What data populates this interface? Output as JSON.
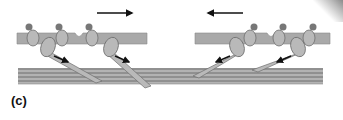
{
  "figure": {
    "panel_label": "(c)",
    "colors": {
      "membrane": "#a9a9a9",
      "membrane_stroke": "#8c8c8c",
      "motor_body": "#b9b9b9",
      "motor_stroke": "#6f6f6f",
      "head_dot": "#777777",
      "filament_fill": "#b0b0b0",
      "filament_line": "#5e5e5e",
      "arrow": "#111111",
      "background": "#ffffff"
    },
    "left_membrane": {
      "x": 17,
      "y": 33,
      "width": 130,
      "height": 11,
      "direction": "right"
    },
    "right_membrane": {
      "x": 195,
      "y": 33,
      "width": 135,
      "height": 11,
      "direction": "left"
    },
    "top_arrows": [
      {
        "x1": 97,
        "x2": 132,
        "y": 13,
        "direction": "right"
      },
      {
        "x1": 243,
        "x2": 208,
        "y": 13,
        "direction": "left"
      }
    ],
    "filament_bundle": {
      "x": 18,
      "y": 68,
      "width": 305,
      "height": 16,
      "lines": 4
    }
  }
}
